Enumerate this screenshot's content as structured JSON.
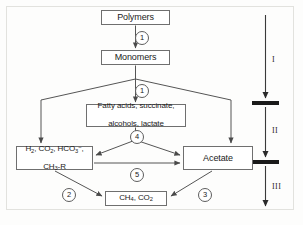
{
  "figure": {
    "line_color": "#555555",
    "box_border_color": "#6f6f6f",
    "bar_color": "#1a1a1a",
    "background": "#fdfdfc"
  },
  "nodes": {
    "polymers": {
      "label": "Polymers"
    },
    "monomers": {
      "label": "Monomers"
    },
    "intermediates": {
      "line1": "Fatty acids, succinate,",
      "line2": "alcohols, lactate"
    },
    "reduced_compounds": {
      "line1_parts": [
        "H",
        "2",
        ", CO",
        "2",
        ", HCO",
        "3",
        "−"
      ],
      "line1_plain": "H2, CO2, HCO3-",
      "line2_plain": "CH3-R"
    },
    "acetate": {
      "label": "Acetate"
    },
    "methane": {
      "line_plain": "CH4, CO2"
    }
  },
  "steps": {
    "s1a": "1",
    "s1b": "1",
    "s2": "2",
    "s3": "3",
    "s4": "4",
    "s5": "5"
  },
  "stages": {
    "one": "I",
    "two": "II",
    "three": "III"
  }
}
